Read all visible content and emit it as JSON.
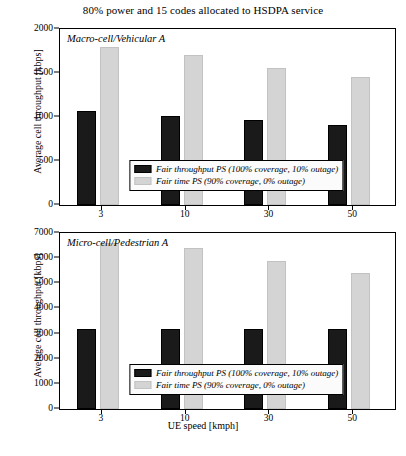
{
  "figure": {
    "title": "80% power and 15 codes allocated to HSDPA service",
    "xlabel": "UE speed [kmph]"
  },
  "colors": {
    "series_dark": "#1a1a1a",
    "series_light": "#d4d4d4",
    "axis": "#000000",
    "background": "#ffffff"
  },
  "legend": {
    "series_dark_label": "Fair throughput PS (100% coverage, 10% outage)",
    "series_light_label": "Fair time PS (90% coverage, 0% outage)"
  },
  "panels": {
    "top": {
      "annotation": "Macro-cell/Vehicular A",
      "ylabel": "Average cell throughput [kbps]",
      "yticks": [
        "0",
        "500",
        "1000",
        "1500",
        "2000"
      ],
      "xticks": [
        "3",
        "10",
        "30",
        "50"
      ]
    },
    "bottom": {
      "annotation": "Micro-cell/Pedestrian A",
      "ylabel": "Average cell throughput [kbps]",
      "yticks": [
        "0",
        "1000",
        "2000",
        "3000",
        "4000",
        "5000",
        "6000",
        "7000"
      ],
      "xticks": [
        "3",
        "10",
        "30",
        "50"
      ]
    }
  },
  "chart_data": [
    {
      "type": "bar",
      "id": "macro-cell-vehicular-a",
      "title": "80% power and 15 codes allocated to HSDPA service",
      "annotation": "Macro-cell/Vehicular A",
      "categories": [
        "3",
        "10",
        "30",
        "50"
      ],
      "series": [
        {
          "name": "Fair throughput PS (100% coverage, 10% outage)",
          "color": "#1a1a1a",
          "values": [
            1070,
            1010,
            970,
            910
          ]
        },
        {
          "name": "Fair time PS (90% coverage, 0% outage)",
          "color": "#d4d4d4",
          "values": [
            1790,
            1700,
            1560,
            1460
          ]
        }
      ],
      "xlabel": "UE speed [kmph]",
      "ylabel": "Average cell throughput [kbps]",
      "ylim": [
        0,
        2000
      ],
      "ytick_step": 500,
      "grid": false,
      "legend_position": "lower-center-inside"
    },
    {
      "type": "bar",
      "id": "micro-cell-pedestrian-a",
      "annotation": "Micro-cell/Pedestrian A",
      "categories": [
        "3",
        "10",
        "30",
        "50"
      ],
      "series": [
        {
          "name": "Fair throughput PS (100% coverage, 10% outage)",
          "color": "#1a1a1a",
          "values": [
            3200,
            3200,
            3200,
            3200
          ]
        },
        {
          "name": "Fair time PS (90% coverage, 0% outage)",
          "color": "#d4d4d4",
          "values": [
            6600,
            6400,
            5900,
            5400
          ]
        }
      ],
      "xlabel": "UE speed [kmph]",
      "ylabel": "Average cell throughput [kbps]",
      "ylim": [
        0,
        7000
      ],
      "ytick_step": 1000,
      "grid": false,
      "legend_position": "lower-center-inside"
    }
  ]
}
